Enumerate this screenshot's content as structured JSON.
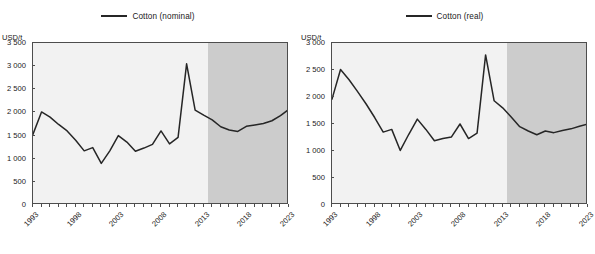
{
  "chart_data": [
    {
      "type": "line",
      "title": "",
      "legend": [
        "Cotton (nominal)"
      ],
      "legend_position": "top-center",
      "xlabel": "",
      "ylabel": "USD/t",
      "ylim": [
        0,
        3500
      ],
      "ytick_labels": [
        "0",
        "500",
        "1 000",
        "1 500",
        "2 000",
        "2 500",
        "3 000",
        "3 500"
      ],
      "ytick_values": [
        0,
        500,
        1000,
        1500,
        2000,
        2500,
        3000,
        3500
      ],
      "xlim": [
        1993,
        2023
      ],
      "xtick_labels": [
        "1993",
        "1998",
        "2003",
        "2008",
        "2013",
        "2018",
        "2023"
      ],
      "xtick_values": [
        1993,
        1998,
        2003,
        2008,
        2013,
        2018,
        2023
      ],
      "minor_xticks_every": 1,
      "grid": false,
      "projection_start": 2013.5,
      "projection_shading_color": "#cccccc",
      "historical_background_color": "#f2f2f2",
      "series": [
        {
          "name": "Cotton (nominal)",
          "x": [
            1993,
            1994,
            1995,
            1996,
            1997,
            1998,
            1999,
            2000,
            2001,
            2002,
            2003,
            2004,
            2005,
            2006,
            2007,
            2008,
            2009,
            2010,
            2011,
            2012,
            2013,
            2014,
            2015,
            2016,
            2017,
            2018,
            2019,
            2020,
            2021,
            2022,
            2023
          ],
          "values": [
            1530,
            2010,
            1900,
            1740,
            1600,
            1400,
            1170,
            1240,
            900,
            1170,
            1500,
            1360,
            1160,
            1230,
            1310,
            1600,
            1320,
            1460,
            3050,
            2050,
            1940,
            1840,
            1690,
            1620,
            1590,
            1700,
            1730,
            1760,
            1820,
            1930,
            2070
          ]
        }
      ]
    },
    {
      "type": "line",
      "title": "",
      "legend": [
        "Cotton (real)"
      ],
      "legend_position": "top-center",
      "xlabel": "",
      "ylabel": "USD/t",
      "ylim": [
        0,
        3000
      ],
      "ytick_labels": [
        "0",
        "500",
        "1 000",
        "1 500",
        "2 000",
        "2 500",
        "3 000"
      ],
      "ytick_values": [
        0,
        500,
        1000,
        1500,
        2000,
        2500,
        3000
      ],
      "xlim": [
        1993,
        2023
      ],
      "xtick_labels": [
        "1993",
        "1998",
        "2003",
        "2008",
        "2013",
        "2018",
        "2023"
      ],
      "xtick_values": [
        1993,
        1998,
        2003,
        2008,
        2013,
        2018,
        2023
      ],
      "minor_xticks_every": 1,
      "grid": false,
      "projection_start": 2013.5,
      "projection_shading_color": "#cccccc",
      "historical_background_color": "#f2f2f2",
      "series": [
        {
          "name": "Cotton (real)",
          "x": [
            1993,
            1994,
            1995,
            1996,
            1997,
            1998,
            1999,
            2000,
            2001,
            2002,
            2003,
            2004,
            2005,
            2006,
            2007,
            2008,
            2009,
            2010,
            2011,
            2012,
            2013,
            2014,
            2015,
            2016,
            2017,
            2018,
            2019,
            2020,
            2021,
            2022,
            2023
          ],
          "values": [
            1960,
            2510,
            2320,
            2100,
            1870,
            1620,
            1350,
            1400,
            1010,
            1310,
            1590,
            1400,
            1190,
            1230,
            1260,
            1500,
            1230,
            1330,
            2780,
            1930,
            1800,
            1630,
            1450,
            1370,
            1300,
            1370,
            1340,
            1380,
            1410,
            1460,
            1500
          ]
        }
      ]
    }
  ],
  "panels": [
    {
      "unit_label": "USD/t",
      "legend_label": "Cotton (nominal)"
    },
    {
      "unit_label": "USD/t",
      "legend_label": "Cotton (real)"
    }
  ]
}
